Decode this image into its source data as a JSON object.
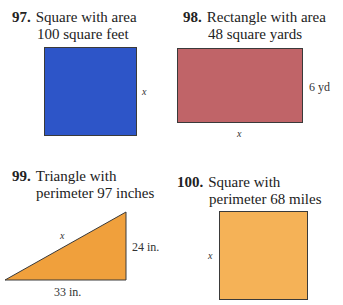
{
  "problems": [
    {
      "number": "97.",
      "line1": "Square with area",
      "line2": "100 square feet",
      "shape": "square",
      "color": "#2d55c8",
      "dimensions": {
        "side": "x"
      }
    },
    {
      "number": "98.",
      "line1": "Rectangle with area",
      "line2": "48 square yards",
      "shape": "rectangle",
      "color": "#c06468",
      "dimensions": {
        "height": "6 yd",
        "width": "x"
      }
    },
    {
      "number": "99.",
      "line1": "Triangle with",
      "line2": "perimeter 97 inches",
      "shape": "right-triangle",
      "color": "#f0a03c",
      "dimensions": {
        "hypotenuse": "x",
        "height": "24 in.",
        "base": "33 in."
      }
    },
    {
      "number": "100.",
      "line1": "Square with",
      "line2": "perimeter 68 miles",
      "shape": "square",
      "color": "#f5b257",
      "dimensions": {
        "side": "x"
      }
    }
  ]
}
